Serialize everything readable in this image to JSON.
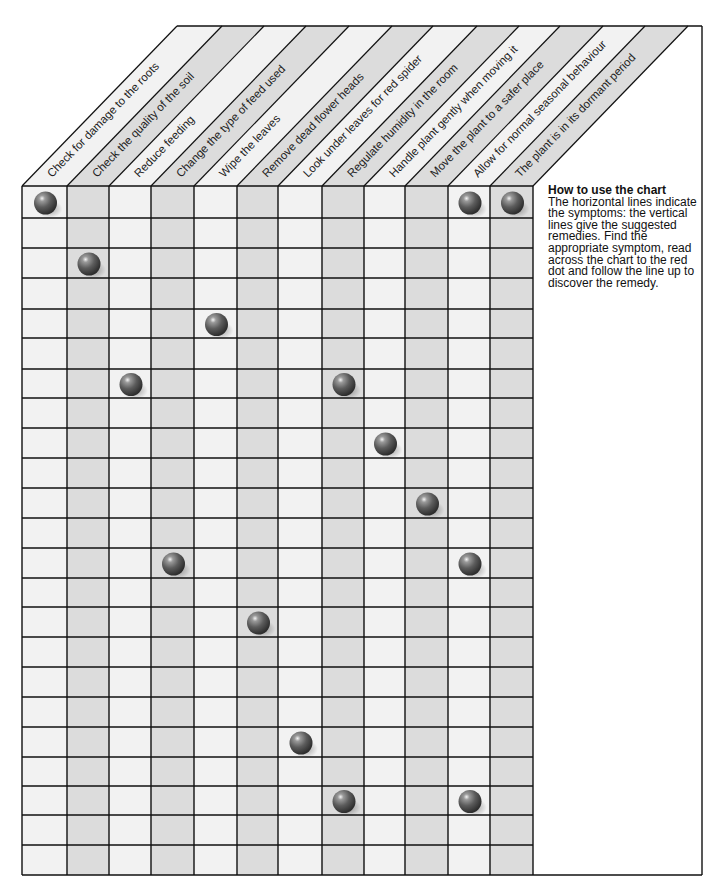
{
  "chart_data": {
    "type": "table",
    "title": "",
    "columns": [
      "Check for damage to the roots",
      "Check the quality of the soil",
      "Reduce feeding",
      "Change the type of feed used",
      "Wipe the leaves",
      "Remove dead flower heads",
      "Look under leaves for red spider",
      "Regulate humidity in the room",
      "Handle plant gently when moving it",
      "Move the plant to a safer place",
      "Allow for normal seasonal behaviour",
      "The plant is in its dormant period"
    ],
    "row_count": 23,
    "dots": [
      {
        "row": 0,
        "col": 0
      },
      {
        "row": 0,
        "col": 10
      },
      {
        "row": 0,
        "col": 11
      },
      {
        "row": 2,
        "col": 1
      },
      {
        "row": 4,
        "col": 4
      },
      {
        "row": 6,
        "col": 2
      },
      {
        "row": 6,
        "col": 7
      },
      {
        "row": 8,
        "col": 8
      },
      {
        "row": 10,
        "col": 9
      },
      {
        "row": 12,
        "col": 3
      },
      {
        "row": 12,
        "col": 10
      },
      {
        "row": 14,
        "col": 5
      },
      {
        "row": 18,
        "col": 6
      },
      {
        "row": 20,
        "col": 7
      },
      {
        "row": 20,
        "col": 10
      }
    ],
    "legend": "red dot = suggested remedy"
  },
  "howto": {
    "title": "How to use the chart",
    "body": "The horizontal lines indicate the symptoms: the vertical lines give the suggested remedies. Find the appropriate symptom, read across the chart to the red dot and follow the line up to discover the remedy."
  },
  "colors": {
    "light_column": "#f2f2f2",
    "shaded_column": "#dcdcdc",
    "grid_line": "#111111",
    "dot": "#555555"
  }
}
